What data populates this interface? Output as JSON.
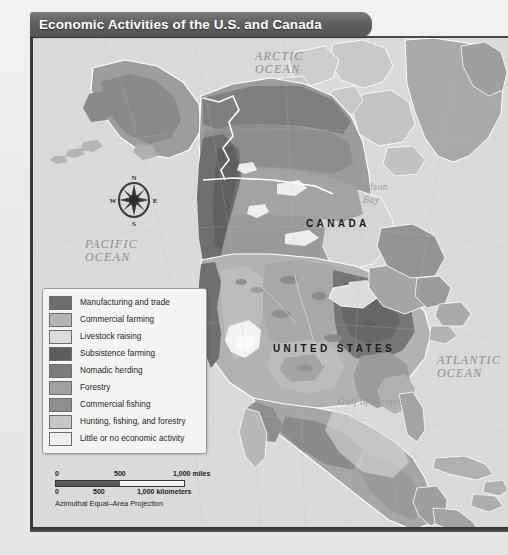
{
  "title": {
    "text": "Economic Activities of the U.S. and Canada"
  },
  "map": {
    "labels": {
      "arctic_ocean": "ARCTIC\nOCEAN",
      "arctic_ocean_l1": "ARCTIC",
      "arctic_ocean_l2": "OCEAN",
      "pacific_ocean_l1": "PACIFIC",
      "pacific_ocean_l2": "OCEAN",
      "atlantic_ocean_l1": "ATLANTIC",
      "atlantic_ocean_l2": "OCEAN",
      "hudson_bay_l1": "Hudson",
      "hudson_bay_l2": "Bay",
      "gulf_of_mexico": "Gulf of Mexico",
      "canada": "CANADA",
      "united_states": "UNITED STATES"
    },
    "compass": {
      "north": "N",
      "east": "E",
      "south": "S",
      "west": "W"
    }
  },
  "legend": {
    "items": [
      {
        "label": "Manufacturing and trade",
        "color": "#6d6d6f"
      },
      {
        "label": "Commercial farming",
        "color": "#b4b4b4"
      },
      {
        "label": "Livestock raising",
        "color": "#dcdcda"
      },
      {
        "label": "Subsistence farming",
        "color": "#5d5d5f"
      },
      {
        "label": "Nomadic herding",
        "color": "#7c7c7e"
      },
      {
        "label": "Forestry",
        "color": "#a0a0a0"
      },
      {
        "label": "Commercial fishing",
        "color": "#8f8f91"
      },
      {
        "label": "Hunting, fishing, and forestry",
        "color": "#c6c6c4"
      },
      {
        "label": "Little or no economic activity",
        "color": "#f0f0ee"
      }
    ]
  },
  "scalebar": {
    "miles": {
      "zero": "0",
      "mid": "500",
      "max": "1,000 miles"
    },
    "kilometers": {
      "zero": "0",
      "mid": "500",
      "max": "1,000 kilometers"
    },
    "projection": "Azimuthal Equal–Area Projection"
  },
  "chart_data": {
    "type": "map",
    "title": "Economic Activities of the U.S. and Canada",
    "projection": "Azimuthal Equal-Area Projection",
    "region": "North America (United States, Canada, Greenland, northern Mexico)",
    "categories": [
      "Manufacturing and trade",
      "Commercial farming",
      "Livestock raising",
      "Subsistence farming",
      "Nomadic herding",
      "Forestry",
      "Commercial fishing",
      "Hunting, fishing, and forestry",
      "Little or no economic activity"
    ],
    "water_bodies": [
      "Arctic Ocean",
      "Pacific Ocean",
      "Atlantic Ocean",
      "Hudson Bay",
      "Gulf of Mexico"
    ],
    "countries": [
      "CANADA",
      "UNITED STATES"
    ],
    "scale_miles": [
      0,
      500,
      1000
    ],
    "scale_kilometers": [
      0,
      500,
      1000
    ]
  }
}
